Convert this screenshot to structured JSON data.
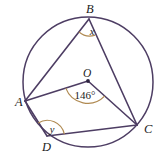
{
  "figure": {
    "type": "circle-geometry-diagram",
    "background_color": "#ffffff",
    "stroke_color": "#4d3d63",
    "arc_color": "#b08a52",
    "label_color": "#1c1c1c",
    "circle": {
      "center_label": "O",
      "cx": 88,
      "cy": 82,
      "r": 65
    },
    "points": [
      {
        "id": "A",
        "label": "A",
        "x": 25,
        "y": 101,
        "label_x": 15,
        "label_y": 106
      },
      {
        "id": "B",
        "label": "B",
        "x": 89,
        "y": 19,
        "label_x": 86,
        "label_y": 13
      },
      {
        "id": "C",
        "label": "C",
        "x": 137,
        "y": 125,
        "label_x": 144,
        "label_y": 133
      },
      {
        "id": "D",
        "label": "D",
        "x": 47,
        "y": 136,
        "label_x": 42,
        "label_y": 151
      },
      {
        "id": "O",
        "label": "O",
        "x": 88,
        "y": 81,
        "label_x": 83,
        "label_y": 77
      }
    ],
    "segments": [
      {
        "name": "segment-AB",
        "from": "A",
        "to": "B"
      },
      {
        "name": "segment-BC",
        "from": "B",
        "to": "C"
      },
      {
        "name": "segment-AO",
        "from": "A",
        "to": "O"
      },
      {
        "name": "segment-OC",
        "from": "O",
        "to": "C"
      },
      {
        "name": "segment-AD",
        "from": "A",
        "to": "D"
      },
      {
        "name": "segment-DC",
        "from": "D",
        "to": "C"
      }
    ],
    "angles": [
      {
        "name": "angle-at-O",
        "vertex": "O",
        "label": "146°",
        "label_x": 85,
        "label_y": 99,
        "marked": true
      },
      {
        "name": "angle-at-B",
        "vertex": "B",
        "label": "x",
        "label_x": 92,
        "label_y": 35,
        "marked": true
      },
      {
        "name": "angle-at-D",
        "vertex": "D",
        "label": "y",
        "label_x": 52,
        "label_y": 133,
        "marked": true
      }
    ]
  }
}
